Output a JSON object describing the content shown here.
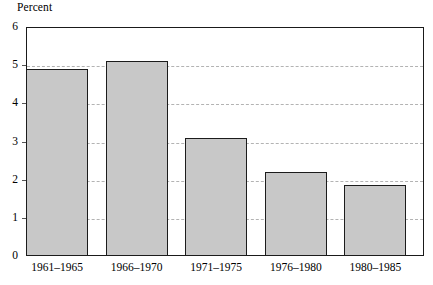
{
  "chart_data": {
    "type": "bar",
    "title": "",
    "ylabel": "Percent",
    "xlabel": "",
    "categories": [
      "1961–1965",
      "1966–1970",
      "1971–1975",
      "1976–1980",
      "1980–1985"
    ],
    "values": [
      4.9,
      5.1,
      3.1,
      2.2,
      1.85
    ],
    "ylim": [
      0,
      6
    ],
    "yticks": [
      "0",
      "1",
      "2",
      "3",
      "4",
      "5",
      "6"
    ],
    "ytick_values": [
      0,
      1,
      2,
      3,
      4,
      5,
      6
    ],
    "grid": "horizontal-dashed",
    "legend": "none",
    "bar_fill_color": "#c8c8c8",
    "bar_border_color": "#1c1c1c",
    "gridline_color": "#b3b3b3",
    "frame_color": "#1a1a1a",
    "background_color": "#ffffff"
  }
}
